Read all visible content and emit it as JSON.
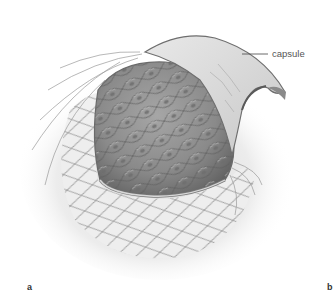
{
  "figure": {
    "callout_label": "capsule",
    "panel_labels": [
      "a",
      "b"
    ],
    "colors": {
      "background": "#ffffff",
      "halo": "#e6e6e6",
      "epithelium_fill": "#8e8e8e",
      "cell_outline": "#666666",
      "capsule_fill": "#dcdcdc",
      "capsule_edge": "#7a7a7a",
      "fiber_stroke": "#9a9a9a",
      "leader_line": "#444444"
    }
  }
}
